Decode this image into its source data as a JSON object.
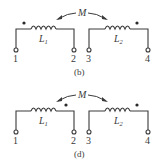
{
  "diagrams": [
    {
      "caption": "(b)",
      "mutual_label": "M",
      "inductors": [
        {
          "label": "L",
          "subscript": "1",
          "dot_position": "left"
        },
        {
          "label": "L",
          "subscript": "2",
          "dot_position": "right"
        }
      ],
      "terminals": [
        "1",
        "2",
        "3",
        "4"
      ]
    },
    {
      "caption": "(d)",
      "mutual_label": "M",
      "inductors": [
        {
          "label": "L",
          "subscript": "1",
          "dot_position": "right"
        },
        {
          "label": "L",
          "subscript": "2",
          "dot_position": "right"
        }
      ],
      "terminals": [
        "1",
        "2",
        "3",
        "4"
      ]
    }
  ],
  "colors": {
    "line": "#3a3a3a",
    "background": "#ffffff"
  }
}
